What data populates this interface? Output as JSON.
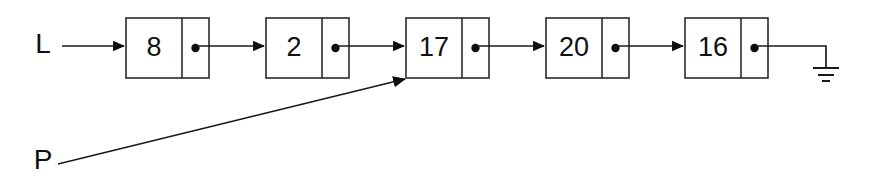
{
  "diagram": {
    "kind": "singly-linked-list",
    "background_color": "#ffffff",
    "ink_color": "#1a1a1a",
    "canvas": {
      "width": 871,
      "height": 188
    },
    "head_pointer": {
      "label": "L",
      "label_x": 43,
      "label_y": 46,
      "arrow_from_x": 62,
      "arrow_to_x": 126,
      "arrow_y": 46,
      "target_node_index": 0
    },
    "aux_pointer": {
      "label": "P",
      "label_x": 43,
      "label_y": 162,
      "arrow_from_x": 58,
      "arrow_from_y": 164,
      "arrow_to_x": 405,
      "arrow_to_y": 79,
      "target_node_index": 2
    },
    "nodes": [
      {
        "value": "8",
        "x": 126,
        "y": 18,
        "data_width": 56,
        "ptr_width": 27,
        "height": 60
      },
      {
        "value": "2",
        "x": 266,
        "y": 18,
        "data_width": 56,
        "ptr_width": 27,
        "height": 60
      },
      {
        "value": "17",
        "x": 406,
        "y": 18,
        "data_width": 56,
        "ptr_width": 27,
        "height": 60
      },
      {
        "value": "20",
        "x": 546,
        "y": 18,
        "data_width": 56,
        "ptr_width": 27,
        "height": 60
      },
      {
        "value": "16",
        "x": 685,
        "y": 18,
        "data_width": 56,
        "ptr_width": 27,
        "height": 60
      }
    ],
    "links": [
      {
        "from_node": 0,
        "to_node": 1,
        "from_x": 196,
        "to_x": 264,
        "y": 46
      },
      {
        "from_node": 1,
        "to_node": 2,
        "from_x": 336,
        "to_x": 404,
        "y": 46
      },
      {
        "from_node": 2,
        "to_node": 3,
        "from_x": 476,
        "to_x": 544,
        "y": 46
      },
      {
        "from_node": 3,
        "to_node": 4,
        "from_x": 615,
        "to_x": 683,
        "y": 46
      }
    ],
    "terminator": {
      "type": "ground-null-symbol",
      "from_x": 756,
      "y": 46,
      "corner_x": 826,
      "stem_bottom_y": 68,
      "bars": [
        {
          "half_width": 13,
          "y": 68
        },
        {
          "half_width": 8,
          "y": 75
        },
        {
          "half_width": 4,
          "y": 81
        }
      ]
    },
    "legend": {
      "node_value_list": "8, 2, 17, 20, 16",
      "pointer_labels": "L, P"
    }
  }
}
